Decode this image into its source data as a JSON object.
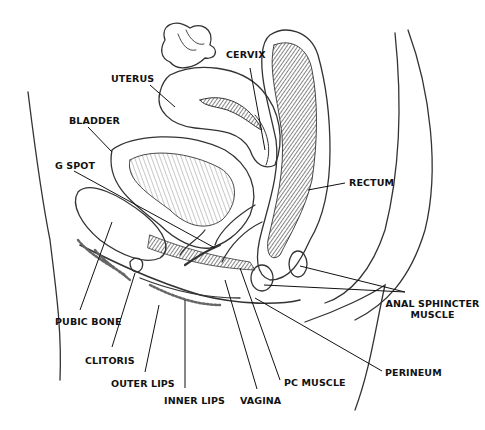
{
  "diagram": {
    "ink_color": "#222222",
    "background": "#ffffff",
    "labels": [
      {
        "id": "cervix",
        "text": "CERVIX",
        "x": 226,
        "y": 55
      },
      {
        "id": "uterus",
        "text": "UTERUS",
        "x": 111,
        "y": 73
      },
      {
        "id": "bladder",
        "text": "BLADDER",
        "x": 69,
        "y": 115
      },
      {
        "id": "rectum",
        "text": "RECTUM",
        "x": 349,
        "y": 177
      },
      {
        "id": "g-spot",
        "text": "G SPOT",
        "x": 55,
        "y": 160
      },
      {
        "id": "anal-sphincter",
        "text": "ANAL SPHINCTER\nMUSCLE",
        "line1": "ANAL SPHINCTER",
        "line2": "MUSCLE",
        "x": 380,
        "y": 300
      },
      {
        "id": "pubic-bone",
        "text": "PUBIC BONE",
        "x": 55,
        "y": 316
      },
      {
        "id": "clitoris",
        "text": "CLITORIS",
        "x": 85,
        "y": 355
      },
      {
        "id": "perineum",
        "text": "PERINEUM",
        "x": 385,
        "y": 367
      },
      {
        "id": "outer-lips",
        "text": "OUTER LIPS",
        "x": 111,
        "y": 378
      },
      {
        "id": "pc-muscle",
        "text": "PC MUSCLE",
        "x": 284,
        "y": 377
      },
      {
        "id": "inner-lips",
        "text": "INNER LIPS",
        "x": 164,
        "y": 395
      },
      {
        "id": "vagina",
        "text": "VAGINA",
        "x": 240,
        "y": 395
      }
    ]
  }
}
